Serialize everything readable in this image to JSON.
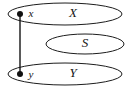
{
  "diagram": {
    "type": "set-membership-diagram",
    "background_color": "#ffffff",
    "stroke_color": "#1d1d1d",
    "dot_color": "#101010",
    "sets": [
      {
        "id": "set-x",
        "label": "X",
        "label_x": 73,
        "label_y": 14,
        "cx": 65,
        "cy": 14,
        "rx": 57,
        "ry": 11
      },
      {
        "id": "set-s",
        "label": "S",
        "label_x": 85,
        "label_y": 44,
        "cx": 85,
        "cy": 44,
        "rx": 39,
        "ry": 10
      },
      {
        "id": "set-y",
        "label": "Y",
        "label_x": 73,
        "label_y": 74,
        "cx": 65,
        "cy": 74,
        "rx": 57,
        "ry": 11
      }
    ],
    "points": [
      {
        "id": "point-x",
        "label": "x",
        "cx": 20,
        "cy": 14,
        "r": 3,
        "label_x": 31,
        "label_y": 14
      },
      {
        "id": "point-y",
        "label": "y",
        "cx": 20,
        "cy": 74,
        "r": 3,
        "label_x": 31,
        "label_y": 75
      }
    ],
    "connector": {
      "id": "connector-x-y",
      "x1": 20,
      "y1": 14,
      "x2": 20,
      "y2": 74
    }
  }
}
